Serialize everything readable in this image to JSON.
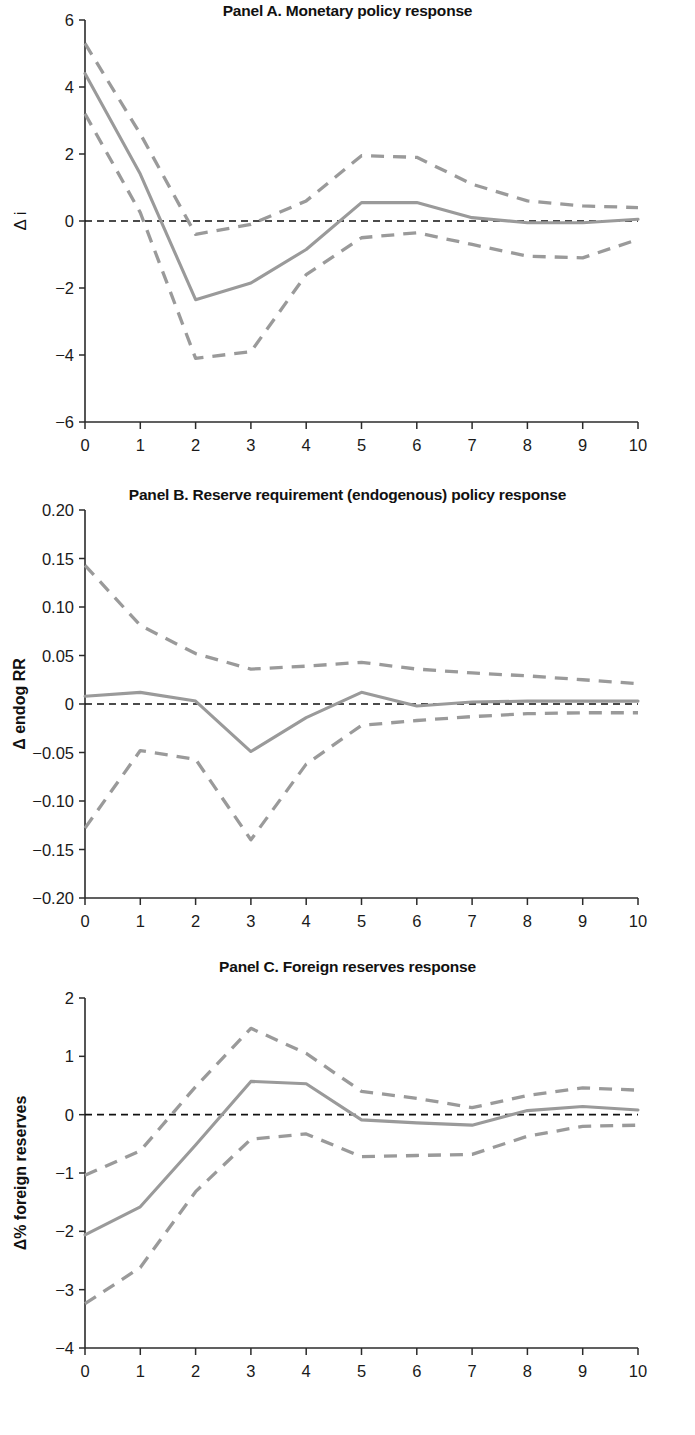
{
  "figure": {
    "title": "",
    "xlabel": "",
    "x_tick_labels": [
      "0",
      "1",
      "2",
      "3",
      "4",
      "5",
      "6",
      "7",
      "8",
      "9",
      "10"
    ],
    "line_color": "#9a9a9a",
    "zero_line_color": "#111111",
    "axis_color": "#2b2b2b"
  },
  "panels": {
    "a": {
      "title": "Panel A. Monetary policy response",
      "ylabel": "Δ i",
      "y_tick_labels": [
        "6",
        "4",
        "2",
        "0",
        "−2",
        "−4",
        "−6"
      ]
    },
    "b": {
      "title": "Panel B. Reserve requirement (endogenous) policy response",
      "ylabel": "Δ endog RR",
      "y_tick_labels": [
        "0.20",
        "0.15",
        "0.10",
        "0.05",
        "0",
        "−0.05",
        "−0.10",
        "−0.15",
        "−0.20"
      ]
    },
    "c": {
      "title": "Panel C. Foreign reserves response",
      "ylabel": "Δ% foreign reserves",
      "y_tick_labels": [
        "2",
        "1",
        "0",
        "−1",
        "−2",
        "−3",
        "−4"
      ]
    }
  },
  "chart_data": [
    {
      "id": "panel-a",
      "type": "line",
      "title": "Panel A. Monetary policy response",
      "xlabel": "",
      "ylabel": "Δ i",
      "x": [
        0,
        1,
        2,
        3,
        4,
        5,
        6,
        7,
        8,
        9,
        10
      ],
      "xlim": [
        0,
        10
      ],
      "ylim": [
        -6,
        6
      ],
      "yticks": [
        6,
        4,
        2,
        0,
        -2,
        -4,
        -6
      ],
      "ytick_labels": [
        "6",
        "4",
        "2",
        "0",
        "−2",
        "−4",
        "−6"
      ],
      "xticks": [
        0,
        1,
        2,
        3,
        4,
        5,
        6,
        7,
        8,
        9,
        10
      ],
      "grid": false,
      "legend": "none",
      "zero_line": 0,
      "series": [
        {
          "name": "Impulse response (point estimate)",
          "style": "solid",
          "values": [
            4.4,
            1.4,
            -2.35,
            -1.85,
            -0.85,
            0.55,
            0.55,
            0.1,
            -0.05,
            -0.05,
            0.05
          ]
        },
        {
          "name": "Upper confidence band",
          "style": "dashed",
          "values": [
            5.3,
            2.6,
            -0.4,
            -0.1,
            0.6,
            1.95,
            1.9,
            1.1,
            0.6,
            0.45,
            0.4
          ]
        },
        {
          "name": "Lower confidence band",
          "style": "dashed",
          "values": [
            3.2,
            0.25,
            -4.1,
            -3.9,
            -1.6,
            -0.5,
            -0.35,
            -0.7,
            -1.05,
            -1.1,
            -0.55
          ]
        }
      ]
    },
    {
      "id": "panel-b",
      "type": "line",
      "title": "Panel B. Reserve requirement (endogenous) policy response",
      "xlabel": "",
      "ylabel": "Δ endog RR",
      "x": [
        0,
        1,
        2,
        3,
        4,
        5,
        6,
        7,
        8,
        9,
        10
      ],
      "xlim": [
        0,
        10
      ],
      "ylim": [
        -0.2,
        0.2
      ],
      "yticks": [
        0.2,
        0.15,
        0.1,
        0.05,
        0,
        -0.05,
        -0.1,
        -0.15,
        -0.2
      ],
      "ytick_labels": [
        "0.20",
        "0.15",
        "0.10",
        "0.05",
        "0",
        "−0.05",
        "−0.10",
        "−0.15",
        "−0.20"
      ],
      "xticks": [
        0,
        1,
        2,
        3,
        4,
        5,
        6,
        7,
        8,
        9,
        10
      ],
      "grid": false,
      "legend": "none",
      "zero_line": 0,
      "series": [
        {
          "name": "Impulse response (point estimate)",
          "style": "solid",
          "values": [
            0.008,
            0.012,
            0.003,
            -0.049,
            -0.014,
            0.012,
            -0.002,
            0.002,
            0.003,
            0.003,
            0.003
          ]
        },
        {
          "name": "Upper confidence band",
          "style": "dashed",
          "values": [
            0.143,
            0.081,
            0.052,
            0.036,
            0.039,
            0.043,
            0.036,
            0.032,
            0.029,
            0.025,
            0.021
          ]
        },
        {
          "name": "Lower confidence band",
          "style": "dashed",
          "values": [
            -0.128,
            -0.048,
            -0.057,
            -0.14,
            -0.062,
            -0.022,
            -0.017,
            -0.013,
            -0.01,
            -0.009,
            -0.009
          ]
        }
      ]
    },
    {
      "id": "panel-c",
      "type": "line",
      "title": "Panel C. Foreign reserves response",
      "xlabel": "",
      "ylabel": "Δ% foreign reserves",
      "x": [
        0,
        1,
        2,
        3,
        4,
        5,
        6,
        7,
        8,
        9,
        10
      ],
      "xlim": [
        0,
        10
      ],
      "ylim": [
        -4,
        2
      ],
      "yticks": [
        2,
        1,
        0,
        -1,
        -2,
        -3,
        -4
      ],
      "ytick_labels": [
        "2",
        "1",
        "0",
        "−1",
        "−2",
        "−3",
        "−4"
      ],
      "xticks": [
        0,
        1,
        2,
        3,
        4,
        5,
        6,
        7,
        8,
        9,
        10
      ],
      "grid": false,
      "legend": "none",
      "zero_line": 0,
      "series": [
        {
          "name": "Impulse response (point estimate)",
          "style": "solid",
          "values": [
            -2.06,
            -1.58,
            -0.52,
            0.57,
            0.53,
            -0.09,
            -0.14,
            -0.18,
            0.07,
            0.14,
            0.08
          ]
        },
        {
          "name": "Upper confidence band",
          "style": "dashed",
          "values": [
            -1.04,
            -0.62,
            0.48,
            1.48,
            1.05,
            0.4,
            0.28,
            0.12,
            0.33,
            0.46,
            0.42
          ]
        },
        {
          "name": "Lower confidence band",
          "style": "dashed",
          "values": [
            -3.24,
            -2.62,
            -1.32,
            -0.42,
            -0.33,
            -0.72,
            -0.7,
            -0.68,
            -0.37,
            -0.2,
            -0.18
          ]
        }
      ]
    }
  ]
}
